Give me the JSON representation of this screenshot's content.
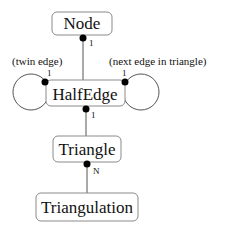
{
  "diagram": {
    "type": "class-relationship",
    "nodes": {
      "node": "Node",
      "halfedge": "HalfEdge",
      "triangle": "Triangle",
      "triangulation": "Triangulation"
    },
    "annotations": {
      "twin": "(twin edge)",
      "next": "(next edge in triangle)"
    },
    "cardinalities": {
      "node_halfedge": "1",
      "twin": "1",
      "next": "1",
      "halfedge_triangle": "1",
      "triangle_triangulation": "N"
    },
    "edges": [
      {
        "from": "HalfEdge",
        "to": "Node",
        "cardinality": "1"
      },
      {
        "from": "HalfEdge",
        "to": "HalfEdge",
        "label": "(twin edge)",
        "cardinality": "1"
      },
      {
        "from": "HalfEdge",
        "to": "HalfEdge",
        "label": "(next edge in triangle)",
        "cardinality": "1"
      },
      {
        "from": "Triangle",
        "to": "HalfEdge",
        "cardinality": "1"
      },
      {
        "from": "Triangulation",
        "to": "Triangle",
        "cardinality": "N"
      }
    ]
  }
}
